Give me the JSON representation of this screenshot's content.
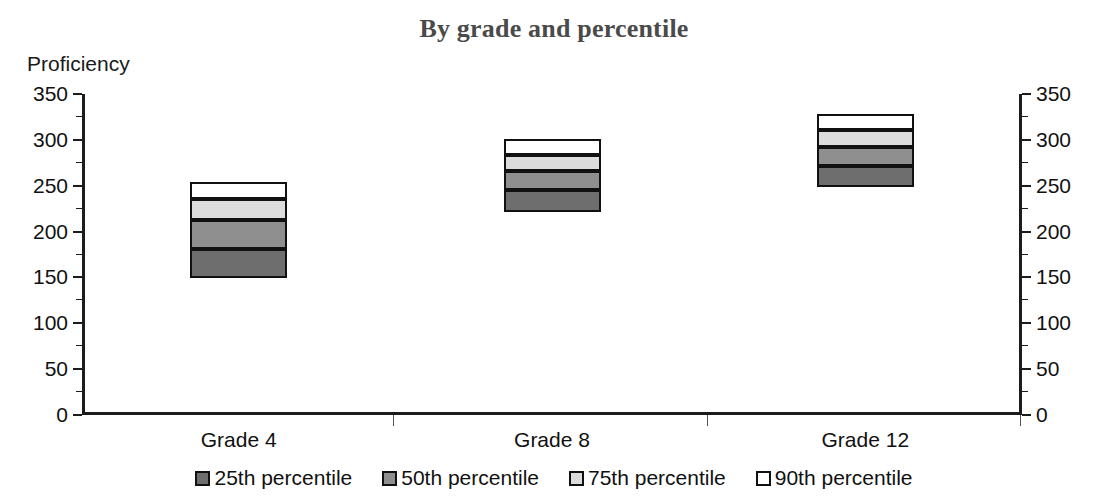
{
  "chart_data": {
    "type": "bar",
    "title": "By grade and percentile",
    "xlabel": "",
    "ylabel": "Proficiency",
    "ylim": [
      0,
      350
    ],
    "ytick_step": 50,
    "yticks": [
      0,
      50,
      100,
      150,
      200,
      250,
      300,
      350
    ],
    "ytick_labels": [
      "0",
      "50",
      "100",
      "150",
      "200",
      "250",
      "300",
      "350"
    ],
    "dual_y_axis": true,
    "grid": false,
    "legend_position": "bottom",
    "categories": [
      "Grade 4",
      "Grade 8",
      "Grade 12"
    ],
    "series": [
      {
        "name": "25th percentile",
        "color": "#6e6e6e",
        "values": [
          149,
          221,
          249
        ]
      },
      {
        "name": "50th percentile",
        "color": "#8f8f8f",
        "values": [
          181,
          245,
          272
        ]
      },
      {
        "name": "75th percentile",
        "color": "#dcdcdc",
        "values": [
          213,
          266,
          292
        ]
      },
      {
        "name": "90th percentile",
        "color": "#ffffff",
        "values": [
          236,
          284,
          311
        ]
      }
    ],
    "bar_tops": [
      254,
      301,
      328
    ]
  },
  "colors": {
    "p25": "#6e6e6e",
    "p50": "#8f8f8f",
    "p75": "#dcdcdc",
    "p90": "#ffffff",
    "outline": "#111111",
    "axis": "#1c1c1c",
    "title": "#4a4a4a"
  },
  "legend": {
    "items": [
      {
        "label": "25th percentile",
        "color": "#6e6e6e"
      },
      {
        "label": "50th percentile",
        "color": "#8f8f8f"
      },
      {
        "label": "75th percentile",
        "color": "#dcdcdc"
      },
      {
        "label": "90th percentile",
        "color": "#ffffff"
      }
    ]
  }
}
